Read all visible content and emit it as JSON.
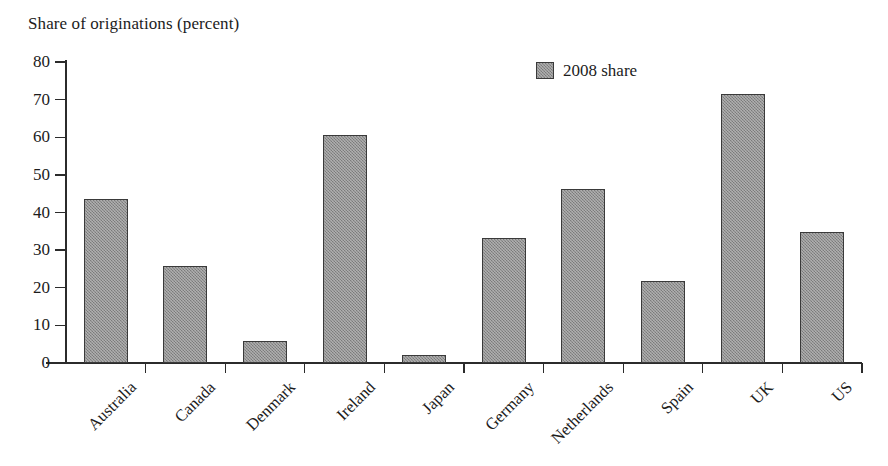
{
  "chart_data": {
    "type": "bar",
    "title": "Share of originations (percent)",
    "xlabel": "",
    "ylabel": "Share of originations (percent)",
    "ylim": [
      0,
      80
    ],
    "yticks": [
      0,
      10,
      20,
      30,
      40,
      50,
      60,
      70,
      80
    ],
    "grid": false,
    "legend_position": "top-right",
    "categories": [
      "Australia",
      "Canada",
      "Denmark",
      "Ireland",
      "Japan",
      "Germany",
      "Netherlands",
      "Spain",
      "UK",
      "US"
    ],
    "series": [
      {
        "name": "2008 share",
        "values": [
          43.5,
          25.7,
          5.9,
          60.5,
          2.0,
          33.2,
          46.2,
          21.7,
          71.5,
          34.8
        ]
      }
    ],
    "colors": {
      "bar_fill": "#8d8d8d",
      "bar_border": "#3a3a3a",
      "axis": "#2b2b2b",
      "text": "#1c1c1c",
      "background": "#ffffff"
    }
  },
  "legend": {
    "entries": [
      {
        "label": "2008 share",
        "swatch": "legend-swatch-gray"
      }
    ]
  },
  "axis": {
    "y_tick_labels": [
      "80",
      "70",
      "60",
      "50",
      "40",
      "30",
      "20",
      "10",
      "0"
    ]
  }
}
